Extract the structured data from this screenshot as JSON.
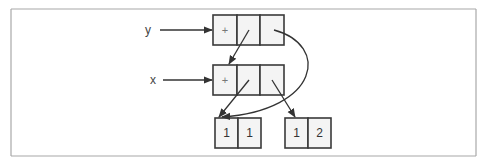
{
  "diagram": {
    "type": "list-structure",
    "labels": {
      "y": "y",
      "x": "x"
    },
    "y_cells": [
      "+",
      "",
      ""
    ],
    "x_cells": [
      "+",
      "",
      ""
    ],
    "pair_left": [
      "1",
      "1"
    ],
    "pair_right": [
      "1",
      "2"
    ],
    "colors": {
      "frame": "#a8a8a8",
      "cell_fill": "#f4f4f4",
      "stroke": "#333333"
    }
  }
}
